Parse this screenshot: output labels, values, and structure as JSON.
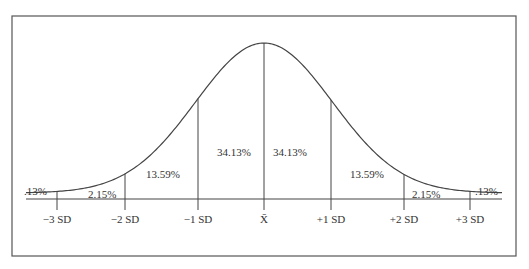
{
  "chart_data": {
    "type": "area",
    "title": "",
    "x_ticks": [
      "−3 SD",
      "−2 SD",
      "−1 SD",
      "X̄",
      "+1 SD",
      "+2 SD",
      "+3 SD"
    ],
    "regions": [
      {
        "range": "< -3 SD",
        "percent": ".13%"
      },
      {
        "range": "-3 SD to -2 SD",
        "percent": "2.15%"
      },
      {
        "range": "-2 SD to -1 SD",
        "percent": "13.59%"
      },
      {
        "range": "-1 SD to mean",
        "percent": "34.13%"
      },
      {
        "range": "mean to +1 SD",
        "percent": "34.13%"
      },
      {
        "range": "+1 SD to +2 SD",
        "percent": "13.59%"
      },
      {
        "range": "+2 SD to +3 SD",
        "percent": "2.15%"
      },
      {
        "range": "> +3 SD",
        "percent": ".13%"
      }
    ],
    "grid": false,
    "legend": null
  },
  "labels": {
    "ticks": [
      "−3 SD",
      "−2 SD",
      "−1 SD",
      "X̄",
      "+1 SD",
      "+2 SD",
      "+3 SD"
    ],
    "pct": [
      ".13%",
      "2.15%",
      "13.59%",
      "34.13%",
      "34.13%",
      "13.59%",
      "2.15%",
      ".13%"
    ]
  }
}
